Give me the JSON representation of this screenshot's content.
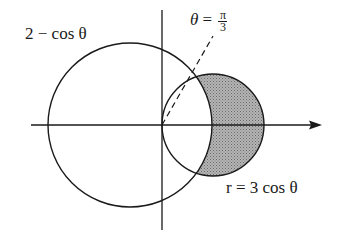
{
  "diagram": {
    "title": "",
    "labels": {
      "outer_curve": "2 − cos θ",
      "ray": {
        "lhs": "θ",
        "eq": "=",
        "num": "π",
        "den": "3"
      },
      "inner_curve": "r = 3 cos θ"
    },
    "curves": [
      {
        "name": "outer",
        "polar": "r = 2 - cos θ"
      },
      {
        "name": "inner",
        "polar": "r = 3 cos θ"
      }
    ],
    "ray_angle": "π/3",
    "shaded_region": "inside r = 3 cos θ and outside r = 2 − cos θ",
    "colors": {
      "stroke": "#1a1a1a",
      "shade": "#9a9a9a",
      "background": "#ffffff"
    }
  }
}
